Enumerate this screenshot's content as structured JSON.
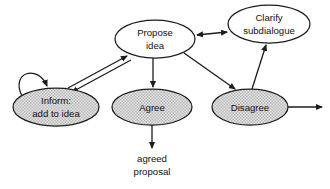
{
  "diagram": {
    "background_color": "#ffffff",
    "stroke_color": "#1c1c1c",
    "fill_color": "#d6d6d6",
    "nodes": [
      {
        "id": "propose-idea",
        "label_line1": "Propose",
        "label_line2": "idea",
        "style": "open",
        "cx": 155,
        "cy": 39,
        "rx": 40,
        "ry": 19
      },
      {
        "id": "clarify-subdialogue",
        "label_line1": "Clarify",
        "label_line2": "subdialogue",
        "style": "open",
        "cx": 269,
        "cy": 24,
        "rx": 41,
        "ry": 19
      },
      {
        "id": "inform-add-to-idea",
        "label_line1": "Inform:",
        "label_line2": "add to idea",
        "style": "filled",
        "cx": 56,
        "cy": 107,
        "rx": 43,
        "ry": 19
      },
      {
        "id": "agree",
        "label_line1": "Agree",
        "label_line2": "",
        "style": "filled",
        "cx": 152,
        "cy": 107,
        "rx": 40,
        "ry": 18
      },
      {
        "id": "disagree",
        "label_line1": "Disagree",
        "label_line2": "",
        "style": "filled",
        "cx": 250,
        "cy": 107,
        "rx": 38,
        "ry": 18
      }
    ],
    "free_labels": [
      {
        "id": "agreed-proposal",
        "line1": "agreed",
        "line2": "proposal",
        "x": 152,
        "y": 165
      }
    ],
    "edges": [
      {
        "id": "inform-self-loop",
        "from": "inform-add-to-idea",
        "to": "inform-add-to-idea",
        "arrowheads": 1
      },
      {
        "id": "inform-to-propose",
        "from": "inform-add-to-idea",
        "to": "propose-idea",
        "arrowheads": 1
      },
      {
        "id": "propose-to-inform",
        "from": "propose-idea",
        "to": "inform-add-to-idea",
        "arrowheads": 1
      },
      {
        "id": "propose-clarify-bidirectional",
        "from": "propose-idea",
        "to": "clarify-subdialogue",
        "arrowheads": 2
      },
      {
        "id": "propose-to-agree",
        "from": "propose-idea",
        "to": "agree",
        "arrowheads": 1
      },
      {
        "id": "propose-to-disagree",
        "from": "propose-idea",
        "to": "disagree",
        "arrowheads": 1
      },
      {
        "id": "disagree-to-clarify",
        "from": "disagree",
        "to": "clarify-subdialogue",
        "arrowheads": 1
      },
      {
        "id": "disagree-to-exit",
        "from": "disagree",
        "to": "exit-right",
        "arrowheads": 1
      },
      {
        "id": "agree-to-agreed-proposal",
        "from": "agree",
        "to": "agreed-proposal",
        "arrowheads": 1
      }
    ]
  }
}
